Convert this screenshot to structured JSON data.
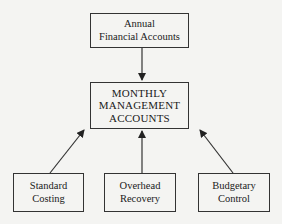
{
  "diagram": {
    "top_box": {
      "lines": [
        "Annual",
        "Financial Accounts"
      ]
    },
    "center_box": {
      "lines": [
        "MONTHLY",
        "MANAGEMENT",
        "ACCOUNTS"
      ]
    },
    "bottom_boxes": [
      {
        "lines": [
          "Standard",
          "Costing"
        ]
      },
      {
        "lines": [
          "Overhead",
          "Recovery"
        ]
      },
      {
        "lines": [
          "Budgetary",
          "Control"
        ]
      }
    ],
    "edges": [
      {
        "from": "Annual Financial Accounts",
        "to": "MONTHLY MANAGEMENT ACCOUNTS"
      },
      {
        "from": "Standard Costing",
        "to": "MONTHLY MANAGEMENT ACCOUNTS"
      },
      {
        "from": "Overhead Recovery",
        "to": "MONTHLY MANAGEMENT ACCOUNTS"
      },
      {
        "from": "Budgetary Control",
        "to": "MONTHLY MANAGEMENT ACCOUNTS"
      }
    ],
    "colors": {
      "background": "#f4f4f2",
      "line": "#333333",
      "text": "#1a1a1a"
    }
  }
}
